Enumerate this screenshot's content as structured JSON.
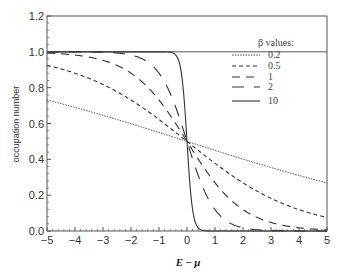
{
  "chart_data": {
    "type": "line",
    "title": "",
    "xlabel": "E − μ",
    "ylabel": "occupation  number",
    "xlim": [
      -5,
      5
    ],
    "ylim": [
      0,
      1.2
    ],
    "xticks": [
      "−5",
      "−4",
      "−3",
      "−2",
      "−1",
      "0",
      "1",
      "2",
      "3",
      "4",
      "5"
    ],
    "xtick_values": [
      -5,
      -4,
      -3,
      -2,
      -1,
      0,
      1,
      2,
      3,
      4,
      5
    ],
    "yticks": [
      "0.0",
      "0.2",
      "0.4",
      "0.6",
      "0.8",
      "1.0",
      "1.2"
    ],
    "ytick_values": [
      0,
      0.2,
      0.4,
      0.6,
      0.8,
      1.0,
      1.2
    ],
    "grid": false,
    "reference_line_y": 1.0,
    "function": "1/(exp(beta*(E-mu))+1)",
    "legend": {
      "title": "β values:",
      "position": "upper right"
    },
    "series": [
      {
        "name": "0.2",
        "beta": 0.2,
        "style": "dotted",
        "x": [
          -5,
          -2.5,
          0,
          2.5,
          5
        ],
        "values": [
          0.731,
          0.622,
          0.5,
          0.378,
          0.269
        ]
      },
      {
        "name": "0.5",
        "beta": 0.5,
        "style": "short-dash",
        "x": [
          -5,
          -2.5,
          0,
          2.5,
          5
        ],
        "values": [
          0.924,
          0.777,
          0.5,
          0.223,
          0.076
        ]
      },
      {
        "name": "1",
        "beta": 1,
        "style": "medium-dash",
        "x": [
          -5,
          -2.5,
          0,
          2.5,
          5
        ],
        "values": [
          0.993,
          0.924,
          0.5,
          0.076,
          0.007
        ]
      },
      {
        "name": "2",
        "beta": 2,
        "style": "long-dash",
        "x": [
          -5,
          -2.5,
          0,
          2.5,
          5
        ],
        "values": [
          1.0,
          0.993,
          0.5,
          0.007,
          0.0
        ]
      },
      {
        "name": "10",
        "beta": 10,
        "style": "solid",
        "x": [
          -5,
          -0.5,
          0,
          0.5,
          5
        ],
        "values": [
          1.0,
          0.993,
          0.5,
          0.007,
          0.0
        ]
      }
    ]
  },
  "footer_text": "the energy function plot of occupation number as function of energy"
}
